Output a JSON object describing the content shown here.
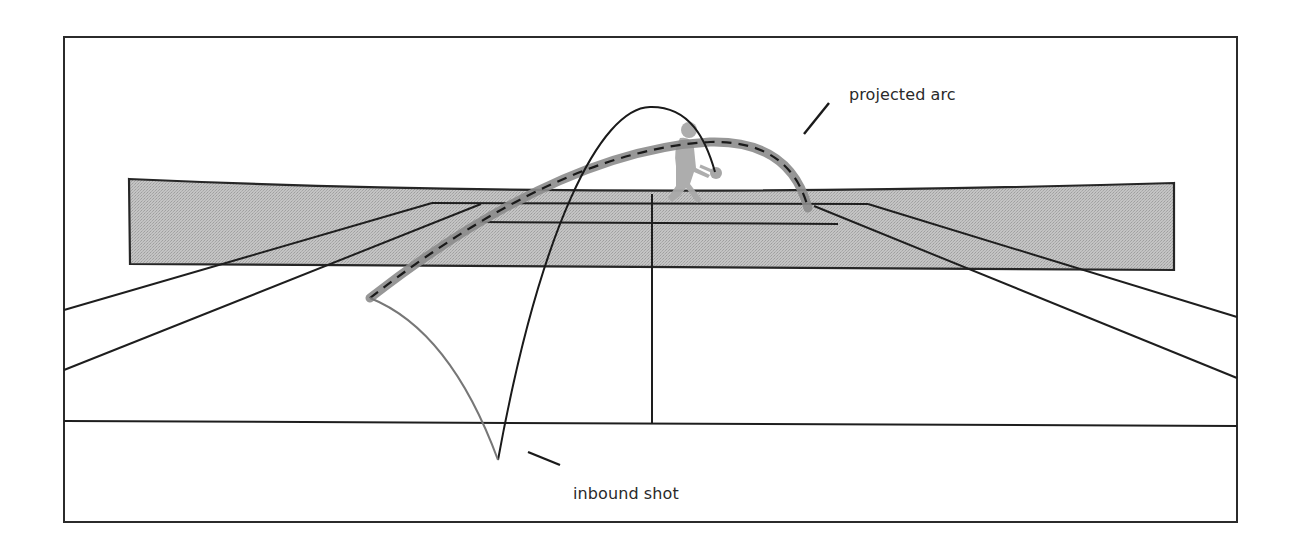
{
  "diagram": {
    "title": "",
    "annotations": {
      "projected_arc": "projected arc",
      "inbound_shot": "inbound shot"
    },
    "elements": [
      {
        "name": "frame",
        "type": "rectangle"
      },
      {
        "name": "shaded-net-band",
        "type": "polygon",
        "fill": "#b8b8b8"
      },
      {
        "name": "tennis-court-lines",
        "type": "perspective-lines"
      },
      {
        "name": "player-silhouette",
        "type": "figure",
        "fill": "#a8a8a8"
      },
      {
        "name": "outbound-arc",
        "type": "curve",
        "stroke": "#1a1a1a"
      },
      {
        "name": "projected-arc",
        "type": "curve",
        "stroke": "#8a8a8a",
        "dash": "#1a1a1a"
      },
      {
        "name": "inbound-shot-curve",
        "type": "curve",
        "stroke": "#7a7a7a"
      }
    ],
    "colors": {
      "line": "#1e1e1e",
      "band_fill": "#bdbdbd",
      "projected_arc": "#8c8c8c",
      "inbound_curve": "#777777",
      "figure": "#a9a9a9",
      "text": "#2a2a2a"
    }
  }
}
